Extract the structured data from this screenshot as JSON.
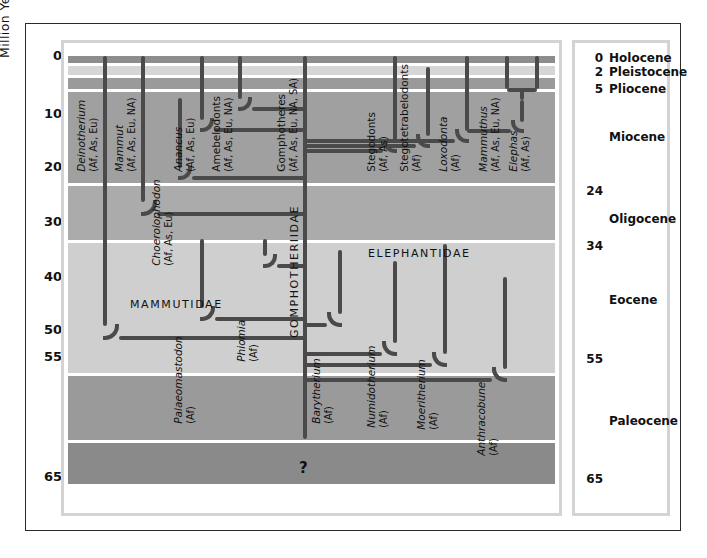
{
  "axis": {
    "title": "Million Years",
    "ticks": [
      {
        "label": "0",
        "my": 0
      },
      {
        "label": "10",
        "my": 10
      },
      {
        "label": "20",
        "my": 20
      },
      {
        "label": "30",
        "my": 30
      },
      {
        "label": "40",
        "my": 40
      },
      {
        "label": "50",
        "my": 50
      },
      {
        "label": "55",
        "my": 55
      },
      {
        "label": "65",
        "my": 65
      }
    ]
  },
  "epochs": [
    {
      "name": "Holocene",
      "num": "0",
      "top_my": 0,
      "base_my": 0.01
    },
    {
      "name": "Pleistocene",
      "num": "2",
      "top_my": 0.01,
      "base_my": 2
    },
    {
      "name": "Pliocene",
      "num": "5",
      "top_my": 2,
      "base_my": 5
    },
    {
      "name": "Miocene",
      "num": "24",
      "top_my": 5,
      "base_my": 24
    },
    {
      "name": "Oligocene",
      "num": "34",
      "top_my": 24,
      "base_my": 34
    },
    {
      "name": "Eocene",
      "num": "55",
      "top_my": 34,
      "base_my": 55
    },
    {
      "name": "Paleocene",
      "num": "65",
      "top_my": 55,
      "base_my": 65
    }
  ],
  "families": [
    {
      "label": "MAMMUTIDAE",
      "orientation": "horizontal"
    },
    {
      "label": "GOMPHOTHERIIDAE",
      "orientation": "vertical"
    },
    {
      "label": "ELEPHANTIDAE",
      "orientation": "horizontal"
    }
  ],
  "uncertainty_marker": "?",
  "taxa": [
    {
      "name": "Deinotherium",
      "regions": "(Af, As, Eu)",
      "italic": true
    },
    {
      "name": "Mammut",
      "regions": "(Af, As, Eu, NA)",
      "italic": true
    },
    {
      "name": "Choerolophodon",
      "regions": "(Af, As, Eu)",
      "italic": true
    },
    {
      "name": "Anancus",
      "regions": "(Af, As, Eu)",
      "italic": true
    },
    {
      "name": "Amebelodonts",
      "regions": "(Af, As, Eu, NA)",
      "italic": false
    },
    {
      "name": "Gomphotheres",
      "regions": "(Af, As, Eu, NA, SA)",
      "italic": false
    },
    {
      "name": "Stegodonts",
      "regions": "(Af, As)",
      "italic": false
    },
    {
      "name": "Stegotetrabelodonts",
      "regions": "(Af)",
      "italic": false
    },
    {
      "name": "Loxodonta",
      "regions": "(Af)",
      "italic": true
    },
    {
      "name": "Mammuthus",
      "regions": "(Af, As, Eu, NA)",
      "italic": true
    },
    {
      "name": "Elephas",
      "regions": "(Af, As)",
      "italic": true
    },
    {
      "name": "Palaeomastodon",
      "regions": "(Af)",
      "italic": true
    },
    {
      "name": "Phiomia",
      "regions": "(Af)",
      "italic": true
    },
    {
      "name": "Barytherium",
      "regions": "(Af)",
      "italic": true
    },
    {
      "name": "Numidotherium",
      "regions": "(Af)",
      "italic": true
    },
    {
      "name": "Moeritherium",
      "regions": "(Af)",
      "italic": true
    },
    {
      "name": "Anthracobune",
      "regions": "(Af)",
      "italic": true
    }
  ],
  "chart_data": {
    "type": "line",
    "xlabel": "",
    "ylabel": "Million Years",
    "ylim": [
      0,
      68
    ],
    "grid": true,
    "legend": "none",
    "y_axis_inverted": true,
    "series": [
      {
        "name": "Deinotherium",
        "x": 105,
        "top_my": 0,
        "origin_my": 51,
        "parent_x": 305
      },
      {
        "name": "Mammut",
        "x": 143,
        "top_my": 0,
        "origin_my": 28.5,
        "parent_x": 305
      },
      {
        "name": "Choerolophodon",
        "x": 180,
        "top_my": 7,
        "origin_my": 22,
        "parent_x": 305
      },
      {
        "name": "Anancus",
        "x": 202,
        "top_my": 0,
        "origin_my": 13,
        "parent_x": 305
      },
      {
        "name": "Amebelodonts",
        "x": 240,
        "top_my": 0,
        "origin_my": 9,
        "parent_x": 305
      },
      {
        "name": "Gomphotheres",
        "x": 305,
        "top_my": 0,
        "origin_my": 58,
        "parent_x": null
      },
      {
        "name": "Stegodonts",
        "x": 395,
        "top_my": 0,
        "origin_my": 17,
        "parent_x": 305
      },
      {
        "name": "Stegotetrabelodonts",
        "x": 428,
        "top_my": 1.5,
        "origin_my": 16,
        "parent_x": 305
      },
      {
        "name": "Loxodonta",
        "x": 467,
        "top_my": 0,
        "origin_my": 13,
        "parent_x": 507
      },
      {
        "name": "Mammuthus",
        "x": 507,
        "top_my": 0,
        "origin_my": 7,
        "parent_x": 537
      },
      {
        "name": "Elephas",
        "x": 537,
        "top_my": 0,
        "origin_my": 7,
        "parent_x": 507
      },
      {
        "name": "Palaeomastodon",
        "x": 202,
        "top_my": 33,
        "origin_my": 48,
        "parent_x": 305
      },
      {
        "name": "Phiomia",
        "x": 265,
        "top_my": 33,
        "origin_my": 38,
        "parent_x": 305
      },
      {
        "name": "Barytherium",
        "x": 340,
        "top_my": 35,
        "origin_my": 49,
        "parent_x": 305
      },
      {
        "name": "Numidotherium",
        "x": 395,
        "top_my": 37,
        "origin_my": 53,
        "parent_x": 305
      },
      {
        "name": "Moeritherium",
        "x": 445,
        "top_my": 34,
        "origin_my": 55,
        "parent_x": 305
      },
      {
        "name": "Anthracobune",
        "x": 505,
        "top_my": 40,
        "origin_my": 56.5,
        "parent_x": 305
      }
    ]
  },
  "colors": {
    "line": "#4a4a4a",
    "grid": "#ffffff",
    "band_dark": "#8d8d8d",
    "band_mid": "#a8a8a8",
    "band_light": "#c8c8c8",
    "band_lighter": "#d6d6d6",
    "frame": "#d3d3d3",
    "outer_frame": "#2b2b2b",
    "text": "#111111"
  }
}
